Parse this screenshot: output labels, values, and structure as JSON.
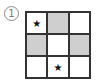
{
  "label": "1",
  "grid": {
    "rows": 3,
    "cols": 3,
    "cells": [
      {
        "shaded": false,
        "mark": "★"
      },
      {
        "shaded": true,
        "mark": ""
      },
      {
        "shaded": false,
        "mark": ""
      },
      {
        "shaded": true,
        "mark": ""
      },
      {
        "shaded": false,
        "mark": ""
      },
      {
        "shaded": true,
        "mark": ""
      },
      {
        "shaded": false,
        "mark": ""
      },
      {
        "shaded": false,
        "mark": "★"
      },
      {
        "shaded": false,
        "mark": ""
      }
    ],
    "shade_color": "#cfcfcf"
  }
}
